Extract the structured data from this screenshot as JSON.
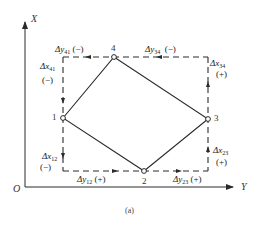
{
  "axes": {
    "x_axis_label": "X",
    "y_axis_label": "Y",
    "origin_label": "O"
  },
  "points": [
    {
      "id": "1",
      "label": "1"
    },
    {
      "id": "2",
      "label": "2"
    },
    {
      "id": "3",
      "label": "3"
    },
    {
      "id": "4",
      "label": "4"
    }
  ],
  "increments": {
    "dy41": {
      "prefix": "Δy",
      "sub": "41",
      "sign": "(−)"
    },
    "dx41": {
      "prefix": "Δx",
      "sub": "41",
      "sign": "(−)"
    },
    "dy34": {
      "prefix": "Δy",
      "sub": "34",
      "sign": "(−)"
    },
    "dx34": {
      "prefix": "Δx",
      "sub": "34",
      "sign": "(+)"
    },
    "dx12": {
      "prefix": "Δx",
      "sub": "12",
      "sign": "(−)"
    },
    "dy12": {
      "prefix": "Δy",
      "sub": "12",
      "sign": "(+)"
    },
    "dy23": {
      "prefix": "Δy",
      "sub": "23",
      "sign": "(+)"
    },
    "dx23": {
      "prefix": "Δx",
      "sub": "23",
      "sign": "(+)"
    }
  },
  "caption": "(a)",
  "colors": {
    "line": "#2a2a2a",
    "text": "#222222",
    "background": "#ffffff"
  }
}
